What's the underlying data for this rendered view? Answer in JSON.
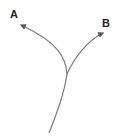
{
  "diagram": {
    "type": "branching-path",
    "labels": {
      "a": "A",
      "b": "B"
    },
    "colors": {
      "line": "#7a7a7a",
      "text": "#222222",
      "background": "#ffffff"
    },
    "branches": [
      {
        "name": "A",
        "direction": "up-left"
      },
      {
        "name": "B",
        "direction": "up-right"
      }
    ]
  }
}
